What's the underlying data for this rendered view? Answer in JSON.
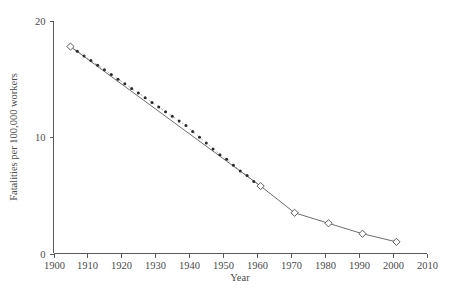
{
  "chart_data": {
    "type": "line",
    "title": "",
    "subtitle": "",
    "xlabel": "Year",
    "ylabel": "Fatalities per 100,000 workers",
    "xlim": [
      1900,
      2010
    ],
    "ylim": [
      0,
      20
    ],
    "xticks": [
      1900,
      1910,
      1920,
      1930,
      1940,
      1950,
      1960,
      1970,
      1980,
      1990,
      2000,
      2010
    ],
    "xtick_labels": [
      "1900",
      "1910",
      "1920",
      "1930",
      "1940",
      "1950",
      "1960",
      "1970",
      "1980",
      "1990",
      "2000",
      "2010"
    ],
    "yticks": [
      0,
      10,
      20
    ],
    "ytick_labels": [
      "0",
      "10",
      "20"
    ],
    "grid": false,
    "legend": "none",
    "series": [
      {
        "name": "Interpolated annual estimate",
        "style": "dotted",
        "marker": "small-filled-dot",
        "x": [
          1905,
          1907,
          1909,
          1911,
          1913,
          1915,
          1917,
          1919,
          1921,
          1923,
          1925,
          1927,
          1929,
          1931,
          1933,
          1935,
          1937,
          1939,
          1941,
          1943,
          1945,
          1947,
          1949,
          1951,
          1953,
          1955,
          1957,
          1959,
          1961
        ],
        "values": [
          17.8,
          17.4,
          17.0,
          16.6,
          16.2,
          15.8,
          15.4,
          15.0,
          14.6,
          14.2,
          13.8,
          13.4,
          13.0,
          12.6,
          12.2,
          11.8,
          11.4,
          11.0,
          10.5,
          10.0,
          9.5,
          9.0,
          8.5,
          8.1,
          7.6,
          7.1,
          6.7,
          6.2,
          5.8
        ]
      },
      {
        "name": "Reported fatality rate",
        "style": "solid",
        "marker": "open-diamond",
        "x": [
          1905,
          1961,
          1971,
          1981,
          1991,
          2001
        ],
        "values": [
          17.8,
          5.8,
          3.5,
          2.6,
          1.7,
          1.0
        ]
      }
    ],
    "marker_points": [
      {
        "year": 1905,
        "value": 17.8
      },
      {
        "year": 1961,
        "value": 5.8
      },
      {
        "year": 1971,
        "value": 3.5
      },
      {
        "year": 1981,
        "value": 2.6
      },
      {
        "year": 1991,
        "value": 1.7
      },
      {
        "year": 2001,
        "value": 1.0
      }
    ]
  }
}
